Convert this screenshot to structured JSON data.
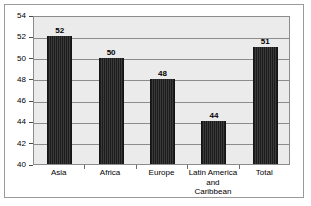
{
  "chart_data": {
    "type": "bar",
    "title": "",
    "subtitle": "",
    "xlabel": "",
    "ylabel": "",
    "categories": [
      "Asia",
      "Africa",
      "Europe",
      "Latin America and Caribbean",
      "Total"
    ],
    "category_lines": [
      [
        "Asia"
      ],
      [
        "Africa"
      ],
      [
        "Europe"
      ],
      [
        "Latin America",
        "and Caribbean"
      ],
      [
        "Total"
      ]
    ],
    "values": [
      52,
      50,
      48,
      44,
      51
    ],
    "value_labels": [
      "52",
      "50",
      "48",
      "44",
      "51"
    ],
    "ylim": [
      40,
      54
    ],
    "yticks": [
      40,
      42,
      44,
      46,
      48,
      50,
      52,
      54
    ],
    "ytick_labels": [
      "40",
      "42",
      "44",
      "46",
      "48",
      "50",
      "52",
      "54"
    ],
    "grid": true,
    "legend": null,
    "legend_position": "none",
    "colors": {
      "bar": "#262626",
      "plot_background": "#ebebeb",
      "gridline": "#8c8c8c",
      "axis": "#4a4a4a",
      "frame": "#9a9a9a",
      "text": "#000000",
      "page_background": "#ffffff"
    }
  }
}
